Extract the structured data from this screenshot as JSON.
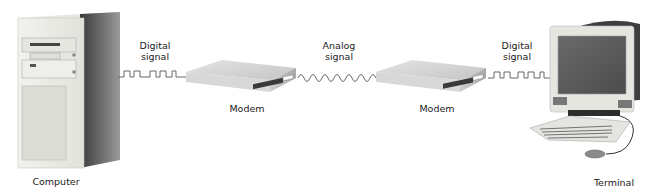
{
  "diagram": {
    "nodes": [
      {
        "id": "computer",
        "label": "Computer"
      },
      {
        "id": "modem1",
        "label": "Modem"
      },
      {
        "id": "modem2",
        "label": "Modem"
      },
      {
        "id": "terminal",
        "label": "Terminal"
      }
    ],
    "signals": [
      {
        "id": "sig1",
        "line1": "Digital",
        "line2": "signal",
        "type": "digital"
      },
      {
        "id": "sig2",
        "line1": "Analog",
        "line2": "signal",
        "type": "analog"
      },
      {
        "id": "sig3",
        "line1": "Digital",
        "line2": "signal",
        "type": "digital"
      }
    ]
  }
}
